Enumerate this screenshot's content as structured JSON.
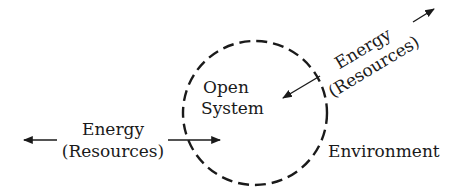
{
  "diagram": {
    "type": "open-system",
    "system_label": {
      "line1": "Open",
      "line2": "System"
    },
    "environment_label": "Environment",
    "left_flow": {
      "line1": "Energy",
      "line2": "(Resources)",
      "direction": "bidirectional"
    },
    "right_flow": {
      "line1": "Energy",
      "line2": "(Resources)",
      "direction": "bidirectional"
    },
    "boundary_style": "dashed",
    "colors": {
      "ink": "#1a1a1a",
      "background": "#ffffff"
    }
  }
}
